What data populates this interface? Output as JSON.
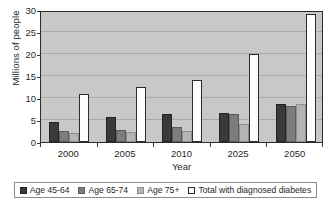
{
  "chart_data": {
    "type": "bar",
    "title": "",
    "xlabel": "Year",
    "ylabel": "Millions of people",
    "categories": [
      "2000",
      "2005",
      "2010",
      "2025",
      "2050"
    ],
    "ylim": [
      0,
      30
    ],
    "yticks": [
      0,
      5,
      10,
      15,
      20,
      25,
      30
    ],
    "ytick_labels": [
      "0",
      "5",
      "10",
      "15",
      "20",
      "25",
      "30"
    ],
    "grid": true,
    "legend_position": "bottom",
    "series": [
      {
        "name": "Age 45-64",
        "color": "#3a3a3a",
        "values": [
          4.6,
          5.6,
          6.4,
          6.7,
          8.6
        ]
      },
      {
        "name": "Age 65-74",
        "color": "#7d7d7d",
        "values": [
          2.5,
          2.8,
          3.4,
          6.4,
          8.2
        ]
      },
      {
        "name": "Age 75+",
        "color": "#b4b4b4",
        "values": [
          2.1,
          2.2,
          2.5,
          4.2,
          8.7
        ]
      },
      {
        "name": "Total with diagnosed diabetes",
        "color": "#fdfdfd",
        "values": [
          10.9,
          12.4,
          14.0,
          19.9,
          29.0
        ]
      }
    ]
  }
}
